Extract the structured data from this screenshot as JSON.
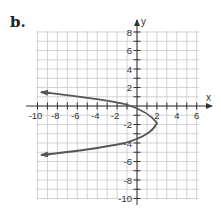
{
  "problem_label": "b.",
  "chart_data": {
    "type": "line",
    "title": "",
    "xlabel": "x",
    "ylabel": "y",
    "xlim": [
      -10,
      6
    ],
    "ylim": [
      -10,
      8
    ],
    "grid": true,
    "x_ticks": [
      -10,
      -8,
      -6,
      -4,
      -2,
      2,
      4,
      6
    ],
    "y_ticks": [
      8,
      6,
      4,
      2,
      -2,
      -4,
      -6,
      -8,
      -10
    ],
    "x_tick_labels": [
      "-10",
      "-8",
      "-6",
      "-4",
      "-2",
      "2",
      "4",
      "6"
    ],
    "y_tick_labels": [
      "8",
      "6",
      "4",
      "2",
      "-2",
      "-4",
      "-6",
      "-8",
      "-10"
    ],
    "series": [
      {
        "name": "parabola opening left",
        "description": "Sideways parabola with vertex near (2, -2), arrows at both ends toward x = -10",
        "vertex": [
          2,
          -2
        ],
        "points": [
          [
            -10,
            1.5
          ],
          [
            -6,
            1.0
          ],
          [
            -2.5,
            0.5
          ],
          [
            -0.5,
            0
          ],
          [
            1,
            -0.6
          ],
          [
            2,
            -1.7
          ],
          [
            1.8,
            -2.6
          ],
          [
            1,
            -3.4
          ],
          [
            -1,
            -4
          ],
          [
            -4,
            -4.6
          ],
          [
            -7.5,
            -5
          ],
          [
            -10,
            -5.3
          ]
        ],
        "color": "#555555",
        "arrows": [
          "upper-left",
          "lower-left"
        ]
      }
    ]
  }
}
